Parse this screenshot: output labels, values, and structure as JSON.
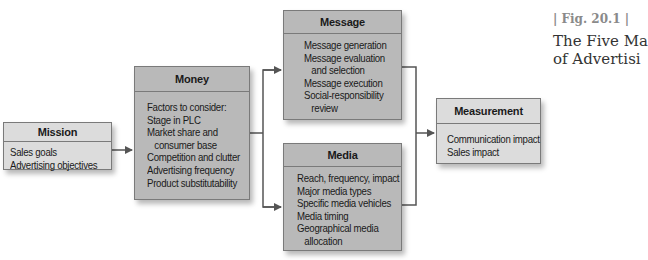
{
  "figure": {
    "label": "| Fig. 20.1 |",
    "title_line1": "The Five Ma",
    "title_line2": "of Advertisi"
  },
  "boxes": {
    "mission": {
      "title": "Mission",
      "items": [
        "Sales goals",
        "Advertising objectives"
      ]
    },
    "money": {
      "title": "Money",
      "items": [
        "Factors to consider:",
        "Stage in PLC",
        "Market share and",
        "consumer base",
        "Competition and clutter",
        "Advertising frequency",
        "Product substitutability"
      ]
    },
    "message": {
      "title": "Message",
      "items": [
        "Message generation",
        "Message evaluation",
        "and selection",
        "Message execution",
        "Social-responsibility",
        "review"
      ]
    },
    "media": {
      "title": "Media",
      "items": [
        "Reach, frequency, impact",
        "Major media types",
        "Specific media vehicles",
        "Media timing",
        "Geographical media",
        "allocation"
      ]
    },
    "measurement": {
      "title": "Measurement",
      "items": [
        "Communication impact",
        "Sales impact"
      ]
    }
  },
  "colors": {
    "light_box": "#dcdcdc",
    "dark_box": "#b9b9b9",
    "connector": "#555555",
    "caption_label": "#8a8a8a"
  }
}
